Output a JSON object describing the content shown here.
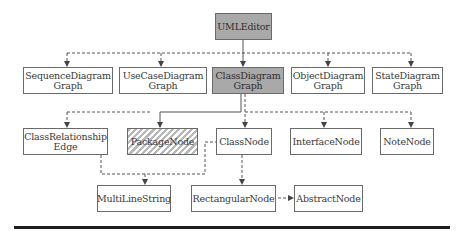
{
  "diagram": {
    "colors": {
      "highlight_fill": "#a9a9a9",
      "hatch_fill": "#b8b8b8",
      "border": "#6a6a6a",
      "line": "#555555",
      "rule": "#1e1e1e"
    },
    "nodes": {
      "uml_editor": {
        "label": "UMLEditor",
        "style": "gray"
      },
      "sequence_diagram_graph": {
        "label_line1": "SequenceDiagram",
        "label_line2": "Graph",
        "style": "plain"
      },
      "use_case_diagram_graph": {
        "label_line1": "UseCaseDiagram",
        "label_line2": "Graph",
        "style": "plain"
      },
      "class_diagram_graph": {
        "label_line1": "ClassDiagram",
        "label_line2": "Graph",
        "style": "gray"
      },
      "object_diagram_graph": {
        "label_line1": "ObjectDiagram",
        "label_line2": "Graph",
        "style": "plain"
      },
      "state_diagram_graph": {
        "label_line1": "StateDiagram",
        "label_line2": "Graph",
        "style": "plain"
      },
      "class_relationship_edge": {
        "label_line1": "ClassRelationship",
        "label_line2": "Edge",
        "style": "plain"
      },
      "package_node": {
        "label": "PackageNode",
        "style": "hatched"
      },
      "class_node": {
        "label": "ClassNode",
        "style": "plain"
      },
      "interface_node": {
        "label": "InterfaceNode",
        "style": "plain"
      },
      "note_node": {
        "label": "NoteNode",
        "style": "plain"
      },
      "multi_line_string": {
        "label": "MultiLineString",
        "style": "plain"
      },
      "rectangular_node": {
        "label": "RectangularNode",
        "style": "plain"
      },
      "abstract_node": {
        "label": "AbstractNode",
        "style": "plain"
      }
    },
    "edges": [
      {
        "from": "UMLEditor",
        "to": "ClassDiagramGraph",
        "style": "solid"
      },
      {
        "from": "UMLEditor",
        "to": "SequenceDiagramGraph",
        "style": "dashed"
      },
      {
        "from": "UMLEditor",
        "to": "UseCaseDiagramGraph",
        "style": "dashed"
      },
      {
        "from": "UMLEditor",
        "to": "ObjectDiagramGraph",
        "style": "dashed"
      },
      {
        "from": "UMLEditor",
        "to": "StateDiagramGraph",
        "style": "dashed"
      },
      {
        "from": "ClassDiagramGraph",
        "to": "PackageNode",
        "style": "solid"
      },
      {
        "from": "ClassDiagramGraph",
        "to": "ClassRelationshipEdge",
        "style": "dashed"
      },
      {
        "from": "ClassDiagramGraph",
        "to": "ClassNode",
        "style": "dashed"
      },
      {
        "from": "ClassDiagramGraph",
        "to": "InterfaceNode",
        "style": "dashed"
      },
      {
        "from": "ClassDiagramGraph",
        "to": "NoteNode",
        "style": "dashed"
      },
      {
        "from": "ClassRelationshipEdge",
        "to": "MultiLineString",
        "style": "dashed"
      },
      {
        "from": "ClassNode",
        "to": "MultiLineString",
        "style": "dashed"
      },
      {
        "from": "ClassNode",
        "to": "RectangularNode",
        "style": "dashed"
      },
      {
        "from": "RectangularNode",
        "to": "AbstractNode",
        "style": "dashed"
      }
    ]
  }
}
